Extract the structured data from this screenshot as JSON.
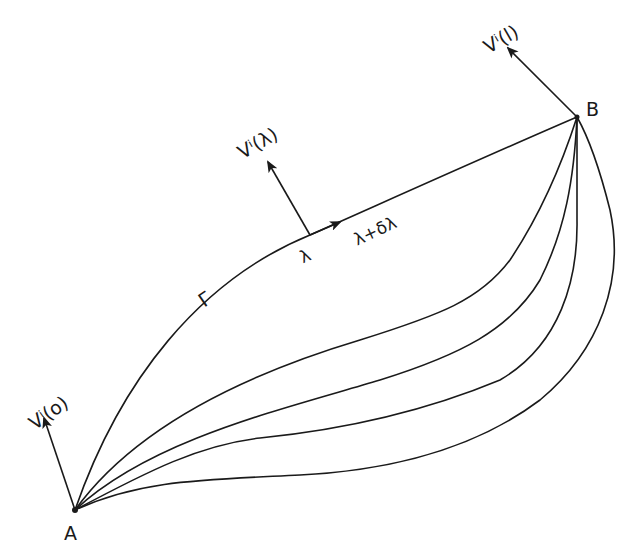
{
  "diagram": {
    "points": {
      "A": {
        "label": "A"
      },
      "B": {
        "label": "B"
      }
    },
    "curve_labels": {
      "gamma": "Γ",
      "lambda": "λ",
      "lambda_plus_delta": "λ+δλ"
    },
    "vectors": {
      "v0": {
        "label": "Vⁱ(o)"
      },
      "vlambda": {
        "label": "Vⁱ(λ)"
      },
      "v1": {
        "label": "Vⁱ(l)"
      }
    },
    "curve_count": 5,
    "stroke_color": "#1a1a1a",
    "background": "#ffffff"
  }
}
